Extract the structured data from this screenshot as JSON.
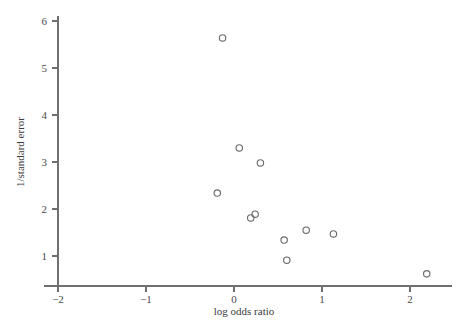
{
  "chart_data": {
    "type": "scatter",
    "title": "",
    "xlabel": "log odds ratio",
    "ylabel": "1/standard error",
    "xlim": [
      -2.35,
      2.45
    ],
    "ylim": [
      0.45,
      6.3
    ],
    "xticks": [
      -2,
      -1,
      0,
      1,
      2
    ],
    "xticklabels": [
      "−2",
      "−1",
      "0",
      "1",
      "2"
    ],
    "yticks": [
      1,
      2,
      3,
      4,
      5,
      6
    ],
    "yticklabels": [
      "1",
      "2",
      "3",
      "4",
      "5",
      "6"
    ],
    "grid": false,
    "legend": null,
    "marker": {
      "shape": "open-circle",
      "color": "#6b6b6b",
      "radius": 3.2
    },
    "points": [
      {
        "x": -0.13,
        "y": 5.64
      },
      {
        "x": 0.06,
        "y": 3.3
      },
      {
        "x": 0.3,
        "y": 2.98
      },
      {
        "x": -0.19,
        "y": 2.34
      },
      {
        "x": 0.24,
        "y": 1.89
      },
      {
        "x": 0.19,
        "y": 1.81
      },
      {
        "x": 0.82,
        "y": 1.55
      },
      {
        "x": 1.13,
        "y": 1.47
      },
      {
        "x": 0.57,
        "y": 1.34
      },
      {
        "x": 0.6,
        "y": 0.91
      },
      {
        "x": 2.19,
        "y": 0.62
      }
    ]
  },
  "axis_colors": {
    "axis": "#707070",
    "marker": "#6b6b6b",
    "text": "#3d3d3d",
    "background": "#ffffff"
  }
}
